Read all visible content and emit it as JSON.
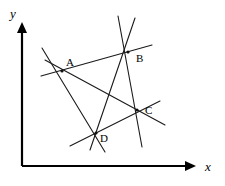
{
  "figure": {
    "background_color": "#ffffff",
    "line_color": "#1a1a1a",
    "axis_color": "#000000",
    "width": 225,
    "height": 186
  },
  "axes": {
    "x_label": "x",
    "y_label": "y",
    "origin": {
      "x": 22,
      "y": 166
    },
    "x_end": {
      "x": 196,
      "y": 166
    },
    "y_end": {
      "x": 22,
      "y": 22
    },
    "x_label_pos": {
      "x": 205,
      "y": 171
    },
    "y_label_pos": {
      "x": 10,
      "y": 18
    }
  },
  "points": [
    {
      "label": "A",
      "x": 62,
      "y": 71,
      "label_x": 66,
      "label_y": 66
    },
    {
      "label": "B",
      "x": 128,
      "y": 52,
      "label_x": 136,
      "label_y": 62
    },
    {
      "label": "C",
      "x": 137,
      "y": 110,
      "label_x": 145,
      "label_y": 114
    },
    {
      "label": "D",
      "x": 96,
      "y": 133,
      "label_x": 100,
      "label_y": 142
    }
  ],
  "lines": [
    {
      "name": "line-A-B",
      "x1": 41,
      "y1": 76,
      "x2": 152,
      "y2": 45
    },
    {
      "name": "line-A-C",
      "x1": 45,
      "y1": 60,
      "x2": 165,
      "y2": 125
    },
    {
      "name": "line-A-D",
      "x1": 42,
      "y1": 48,
      "x2": 105,
      "y2": 152
    },
    {
      "name": "line-B-D",
      "x1": 135,
      "y1": 18,
      "x2": 90,
      "y2": 150
    },
    {
      "name": "line-B-C",
      "x1": 118,
      "y1": 16,
      "x2": 142,
      "y2": 147
    },
    {
      "name": "line-D-C",
      "x1": 70,
      "y1": 146,
      "x2": 160,
      "y2": 101
    }
  ]
}
